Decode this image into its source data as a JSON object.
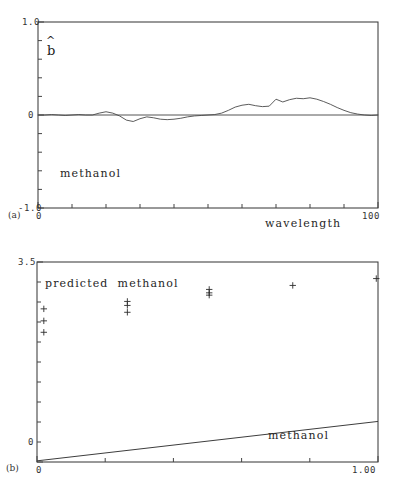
{
  "figure": {
    "panels": [
      {
        "tag": "(a)",
        "annotation": "methanol",
        "ylabel_symbol": "b",
        "ylabel_hat": "^",
        "xaxis_title": "wavelength"
      },
      {
        "tag": "(b)",
        "annotation_top": "predicted  methanol",
        "annotation_bottom": "methanol"
      }
    ]
  },
  "chart_data": [
    {
      "type": "line",
      "panel": "(a)",
      "title": "",
      "xlabel": "wavelength",
      "ylabel": "b̂",
      "annotation": "methanol",
      "xlim": [
        0,
        100
      ],
      "ylim": [
        -1.0,
        1.0
      ],
      "xticks": [
        0,
        100
      ],
      "xtick_labels": [
        "0",
        "100"
      ],
      "yticks": [
        -1.0,
        0,
        1.0
      ],
      "ytick_labels": [
        "-1.0",
        "0",
        "1.0"
      ],
      "minor_ticks": true,
      "grid": false,
      "legend": "none",
      "x": [
        0,
        2,
        4,
        6,
        8,
        10,
        12,
        14,
        16,
        18,
        20,
        22,
        24,
        26,
        28,
        30,
        32,
        34,
        36,
        38,
        40,
        42,
        44,
        46,
        48,
        50,
        52,
        54,
        56,
        58,
        60,
        62,
        64,
        66,
        68,
        70,
        72,
        74,
        76,
        78,
        80,
        82,
        84,
        86,
        88,
        90,
        92,
        94,
        96,
        98,
        100
      ],
      "values": [
        0.0,
        0.0,
        0.005,
        0.0,
        -0.005,
        0.0,
        0.005,
        0.0,
        0.0,
        0.02,
        0.035,
        0.02,
        -0.01,
        -0.055,
        -0.07,
        -0.04,
        -0.02,
        -0.03,
        -0.045,
        -0.05,
        -0.045,
        -0.035,
        -0.02,
        -0.01,
        -0.005,
        0.0,
        0.005,
        0.02,
        0.05,
        0.085,
        0.105,
        0.115,
        0.1,
        0.09,
        0.095,
        0.17,
        0.14,
        0.165,
        0.18,
        0.175,
        0.185,
        0.17,
        0.145,
        0.115,
        0.08,
        0.05,
        0.025,
        0.01,
        0.0,
        -0.005,
        0.0
      ]
    },
    {
      "type": "scatter",
      "panel": "(b)",
      "title": "",
      "xlabel": "methanol",
      "ylabel": "predicted  methanol",
      "xlim": [
        0,
        1.0
      ],
      "ylim": [
        0,
        3.5
      ],
      "xticks": [
        0,
        1.0
      ],
      "xtick_labels": [
        "0",
        "1.00"
      ],
      "yticks": [
        0,
        3.5
      ],
      "ytick_labels": [
        "0",
        "3.5"
      ],
      "minor_ticks": true,
      "grid": false,
      "legend": "none",
      "points": [
        {
          "x": 0.02,
          "y": 2.68
        },
        {
          "x": 0.02,
          "y": 2.47
        },
        {
          "x": 0.02,
          "y": 2.27
        },
        {
          "x": 0.265,
          "y": 2.81
        },
        {
          "x": 0.265,
          "y": 2.74
        },
        {
          "x": 0.265,
          "y": 2.62
        },
        {
          "x": 0.505,
          "y": 3.02
        },
        {
          "x": 0.505,
          "y": 2.96
        },
        {
          "x": 0.505,
          "y": 2.92
        },
        {
          "x": 0.75,
          "y": 3.09
        },
        {
          "x": 0.995,
          "y": 3.21
        }
      ],
      "fit_line": {
        "x": [
          0,
          1.0
        ],
        "y": [
          0.02,
          0.71
        ]
      }
    }
  ]
}
